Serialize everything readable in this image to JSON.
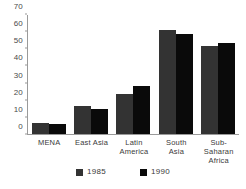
{
  "top_caption": "",
  "chart_data": {
    "type": "bar",
    "title": "",
    "subtitle": "",
    "xlabel": "",
    "ylabel": "",
    "ylim": [
      0,
      70
    ],
    "yticks": [
      70,
      60,
      50,
      40,
      30,
      20,
      10,
      0
    ],
    "grid": false,
    "legend_position": "bottom",
    "categories": [
      "MENA",
      "East Asia",
      "Latin\nAmerica",
      "South\nAsia",
      "Sub-\nSaharan\nAfrica"
    ],
    "category_labels": [
      [
        "MENA"
      ],
      [
        "East Asia"
      ],
      [
        "Latin",
        "America"
      ],
      [
        "South",
        "Asia"
      ],
      [
        "Sub-",
        "Saharan",
        "Africa"
      ]
    ],
    "series": [
      {
        "name": "1985",
        "color": "#333333",
        "values": [
          6.5,
          16.5,
          23.5,
          61,
          52
        ]
      },
      {
        "name": "1990",
        "color": "#0a0a0a",
        "values": [
          6,
          15,
          28,
          59,
          53.5
        ]
      }
    ]
  },
  "legend": {
    "items": [
      {
        "label": "1985",
        "color": "#333333"
      },
      {
        "label": "1990",
        "color": "#0a0a0a"
      }
    ]
  }
}
